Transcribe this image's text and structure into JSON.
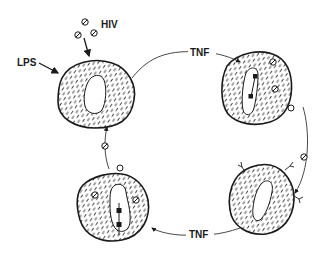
{
  "diagram": {
    "type": "cycle",
    "labels": {
      "hiv": "HIV",
      "lps": "LPS",
      "tnf_top": "TNF",
      "tnf_bottom": "TNF"
    },
    "nodes": [
      {
        "id": "cell-top-left",
        "description": "Macrophage exposed to HIV and LPS"
      },
      {
        "id": "cell-top-right",
        "description": "Infected cell with integrated provirus and virions"
      },
      {
        "id": "cell-bottom-right",
        "description": "Cell with surface receptors receiving virion"
      },
      {
        "id": "cell-bottom-left",
        "description": "Infected cell with integrated provirus, budding virion"
      }
    ],
    "edges": [
      {
        "from": "cell-top-left",
        "to": "cell-top-right",
        "label": "TNF"
      },
      {
        "from": "cell-top-right",
        "to": "cell-bottom-right",
        "label": "virion"
      },
      {
        "from": "cell-bottom-right",
        "to": "cell-bottom-left",
        "label": "TNF"
      },
      {
        "from": "cell-bottom-left",
        "to": "cell-top-left",
        "label": "virion"
      }
    ],
    "colors": {
      "stroke": "#1a1a1a",
      "background": "#ffffff"
    }
  }
}
